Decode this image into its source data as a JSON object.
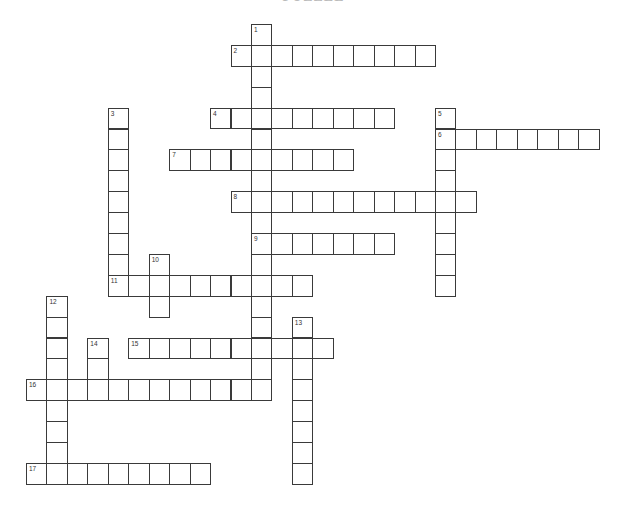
{
  "puzzle": {
    "title": "PUZZLE",
    "grid_origin": {
      "x": 26,
      "y": 24
    },
    "cell_step": {
      "x": 20.45,
      "y": 20.9
    },
    "line_color": "#3a3a3a",
    "words": [
      {
        "number": "1",
        "direction": "down",
        "col": 11,
        "row": 0,
        "length": 18
      },
      {
        "number": "2",
        "direction": "across",
        "col": 10,
        "row": 1,
        "length": 10
      },
      {
        "number": "3",
        "direction": "down",
        "col": 4,
        "row": 4,
        "length": 9
      },
      {
        "number": "4",
        "direction": "across",
        "col": 9,
        "row": 4,
        "length": 9
      },
      {
        "number": "5",
        "direction": "down",
        "col": 20,
        "row": 4,
        "length": 9
      },
      {
        "number": "6",
        "direction": "across",
        "col": 20,
        "row": 5,
        "length": 8
      },
      {
        "number": "7",
        "direction": "across",
        "col": 7,
        "row": 6,
        "length": 9
      },
      {
        "number": "8",
        "direction": "across",
        "col": 10,
        "row": 8,
        "length": 12
      },
      {
        "number": "9",
        "direction": "across",
        "col": 11,
        "row": 10,
        "length": 7
      },
      {
        "number": "10",
        "direction": "down",
        "col": 6,
        "row": 11,
        "length": 3
      },
      {
        "number": "11",
        "direction": "across",
        "col": 4,
        "row": 12,
        "length": 10
      },
      {
        "number": "12",
        "direction": "down",
        "col": 1,
        "row": 13,
        "length": 9
      },
      {
        "number": "13",
        "direction": "down",
        "col": 13,
        "row": 14,
        "length": 8
      },
      {
        "number": "14",
        "direction": "down",
        "col": 3,
        "row": 15,
        "length": 3
      },
      {
        "number": "15",
        "direction": "across",
        "col": 5,
        "row": 15,
        "length": 10
      },
      {
        "number": "16",
        "direction": "across",
        "col": 0,
        "row": 17,
        "length": 12
      },
      {
        "number": "17",
        "direction": "across",
        "col": 0,
        "row": 21,
        "length": 9
      }
    ]
  }
}
